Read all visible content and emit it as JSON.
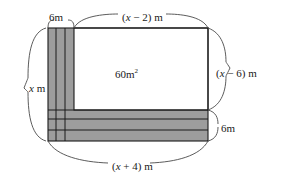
{
  "figure": {
    "kind": "geometry-diagram",
    "colors": {
      "stroke": "#1a1a1a",
      "shaded_band": "#9d9d9d",
      "inner_fill": "#ffffff",
      "background": "#ffffff"
    },
    "labels": {
      "top_width": "(x − 2) m",
      "top_width_prefix": "(",
      "left_height": "x m",
      "strip_width": "6m",
      "inner_area": "60m",
      "inner_area_exponent": "2",
      "right_height": "(x − 6) m",
      "band_height": "6m",
      "bottom_width": "(x + 4) m"
    },
    "label_parts": {
      "top_width_open": "(",
      "top_width_var": "x",
      "top_width_op": " − 2) m",
      "right_height_open": "(",
      "right_height_var": "x",
      "right_height_op": " − 6) m",
      "bottom_width_open": "(",
      "bottom_width_var": "x",
      "bottom_width_op": " + 4) m",
      "left_height_var": "x",
      "left_height_unit": " m"
    },
    "geometry": {
      "outer_left": 48,
      "outer_right": 208,
      "outer_top": 28,
      "outer_bottom": 141,
      "vertical_strip_right": 74,
      "horizontal_band_top": 110,
      "vertical_strip_dividers": [
        56,
        65
      ],
      "horizontal_band_dividers": [
        118,
        128
      ]
    }
  }
}
